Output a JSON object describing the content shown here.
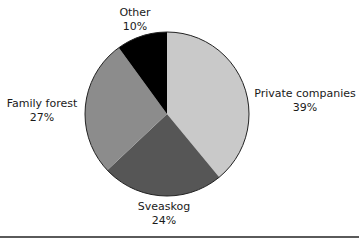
{
  "chart_data": {
    "type": "pie",
    "title": "",
    "categories": [
      "Private companies",
      "Sveaskog",
      "Family forest",
      "Other"
    ],
    "values": [
      39,
      24,
      27,
      10
    ],
    "units": "%",
    "colors": [
      "#c9c9c9",
      "#565656",
      "#8c8c8c",
      "#000000"
    ],
    "start_angle_deg": 0,
    "direction": "clockwise",
    "legend": "none (direct labels)"
  },
  "labels": [
    {
      "name": "Private companies",
      "value": "39%"
    },
    {
      "name": "Sveaskog",
      "value": "24%"
    },
    {
      "name": "Family forest",
      "value": "27%"
    },
    {
      "name": "Other",
      "value": "10%"
    }
  ]
}
